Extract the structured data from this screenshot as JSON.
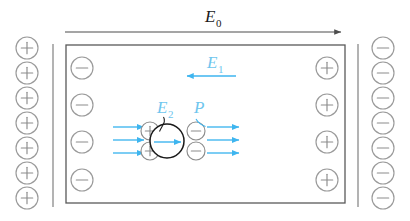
{
  "figure": {
    "background_color": "#ffffff"
  },
  "colors": {
    "external_field_arrow": "#4d4d4d",
    "capacitor_plate_line": "#808080",
    "charge_circle_outline": "#9a9a9a",
    "charge_symbol": "#8c8c8c",
    "dielectric_box_border": "#595959",
    "sphere_outline": "#1a1a1a",
    "polarization_blue": "#3eb5ef",
    "label_blue": "#6ec6ee",
    "label_black": "#1a1a1a"
  },
  "labels": {
    "e0": {
      "base": "E",
      "sub": "0",
      "color": "#1a1a1a",
      "x": 205,
      "y": 22
    },
    "e1": {
      "base": "E",
      "sub": "1",
      "color": "#6ec6ee",
      "x": 207,
      "y": 68
    },
    "e2": {
      "base": "E",
      "sub": "2",
      "color": "#6ec6ee",
      "x": 157,
      "y": 113
    },
    "p": {
      "base": "P",
      "sub": "",
      "color": "#6ec6ee",
      "x": 194,
      "y": 113
    }
  },
  "external_field": {
    "name": "E0",
    "description": "Uniform applied field arrow pointing right above the dielectric slab",
    "x_start": 65,
    "x_end": 346,
    "y": 32,
    "direction": "right",
    "color": "#4d4d4d"
  },
  "depolarization_field": {
    "name": "E1",
    "description": "Depolarization field inside the dielectric pointing left",
    "x_start": 236,
    "x_end": 184,
    "y": 76,
    "direction": "left",
    "color": "#3eb5ef"
  },
  "dielectric_box": {
    "x": 66,
    "y": 45,
    "width": 279,
    "height": 158,
    "border_color": "#595959"
  },
  "plates": {
    "left_plate": {
      "name": "positive-capacitor-plate",
      "line_x": 53,
      "line_y_start": 44,
      "line_y_end": 207,
      "charge_symbol": "+",
      "circle_x": 27,
      "circle_radius": 11,
      "circle_y_values": [
        48,
        73,
        98,
        123,
        148,
        173,
        198
      ],
      "count": 7
    },
    "right_plate": {
      "name": "negative-capacitor-plate",
      "line_x": 358,
      "line_y_start": 44,
      "line_y_end": 207,
      "charge_symbol": "−",
      "circle_x": 383,
      "circle_radius": 11,
      "circle_y_values": [
        48,
        73,
        98,
        123,
        148,
        173,
        198
      ],
      "count": 7
    }
  },
  "bound_surface_charges": {
    "left_face": {
      "name": "bound-negative-surface-charge",
      "charge_symbol": "−",
      "circle_x": 82,
      "circle_radius": 11,
      "circle_y_values": [
        68,
        105,
        142,
        180
      ],
      "count": 4
    },
    "right_face": {
      "name": "bound-positive-surface-charge",
      "charge_symbol": "+",
      "circle_x": 327,
      "circle_radius": 11,
      "circle_y_values": [
        68,
        105,
        142,
        180
      ],
      "count": 4
    }
  },
  "sphere": {
    "name": "polarized-dielectric-sphere",
    "cx": 167,
    "cy": 141,
    "r": 17,
    "outline_color": "#1a1a1a",
    "inner_arrow": {
      "x_start": 154,
      "x_end": 180,
      "y": 142,
      "direction": "right",
      "color": "#3eb5ef"
    },
    "leader_line": {
      "description": "curved leader from E2 label into the sphere",
      "from_x": 163,
      "from_y": 117,
      "to_x": 160,
      "to_y": 130
    }
  },
  "sphere_charges": {
    "left_positive": {
      "name": "sphere-positive-charge",
      "charge_symbol": "+",
      "circle_x": 150,
      "circle_radius": 9,
      "circle_y_values": [
        131,
        151
      ],
      "count": 2
    },
    "right_negative": {
      "name": "sphere-negative-charge",
      "charge_symbol": "−",
      "circle_x": 196,
      "circle_radius": 9,
      "circle_y_values": [
        131,
        151
      ],
      "count": 2
    }
  },
  "polarization_arrows": {
    "color": "#3eb5ef",
    "left_group": {
      "name": "incoming-polarization-arrows",
      "x_start": 113,
      "x_end": 144,
      "direction": "right",
      "y_values": [
        127,
        140,
        153
      ],
      "count": 3
    },
    "right_group": {
      "name": "outgoing-polarization-arrows",
      "x_start": 207,
      "x_end": 239,
      "direction": "right",
      "y_values": [
        127,
        140,
        153
      ],
      "count": 3
    },
    "p_leader": {
      "name": "p-label-leader",
      "description": "short curved tick from the P label down to the top right arrow",
      "from_x": 196,
      "from_y": 118,
      "to_x": 204,
      "to_y": 126
    }
  },
  "chart_data": {
    "type": "diagram",
    "annotations": [
      "E0",
      "E1",
      "E2",
      "P"
    ],
    "series": [
      {
        "name": "E0",
        "description": "applied external field, points right",
        "magnitude_direction": "right"
      },
      {
        "name": "E1",
        "description": "depolarizing field of the slab, points left",
        "magnitude_direction": "left"
      },
      {
        "name": "E2",
        "description": "field inside the spherical cavity, points right",
        "magnitude_direction": "right"
      },
      {
        "name": "P",
        "description": "polarization vector, points right",
        "magnitude_direction": "right"
      }
    ]
  }
}
